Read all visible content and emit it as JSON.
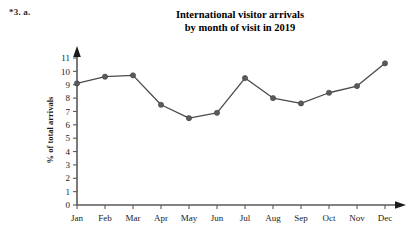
{
  "exercise_label": "*3. a.",
  "title": {
    "line1": "International visitor arrivals",
    "line2": "by month of visit in 2019"
  },
  "chart_data": {
    "type": "line",
    "title": "International visitor arrivals by month of visit in 2019",
    "xlabel": "",
    "ylabel": "% of total arrivals",
    "categories": [
      "Jan",
      "Feb",
      "Mar",
      "Apr",
      "May",
      "Jun",
      "Jul",
      "Aug",
      "Sep",
      "Oct",
      "Nov",
      "Dec"
    ],
    "values": [
      9.1,
      9.6,
      9.7,
      7.5,
      6.5,
      6.9,
      9.5,
      8.0,
      7.6,
      8.4,
      8.9,
      10.6
    ],
    "ylim": [
      0,
      11
    ],
    "yticks": [
      0,
      1,
      2,
      3,
      4,
      5,
      6,
      7,
      8,
      9,
      10,
      11
    ],
    "ytick_labels": [
      "0",
      "1",
      "2",
      "3",
      "4",
      "5",
      "6",
      "7",
      "8",
      "9",
      "10",
      "11"
    ],
    "grid": false,
    "legend": "none",
    "marker": "filled-circle",
    "line_color": "#4a4a4c",
    "marker_color": "#5b5b5d",
    "axis_color": "#59595b",
    "background": "#ffffff"
  }
}
